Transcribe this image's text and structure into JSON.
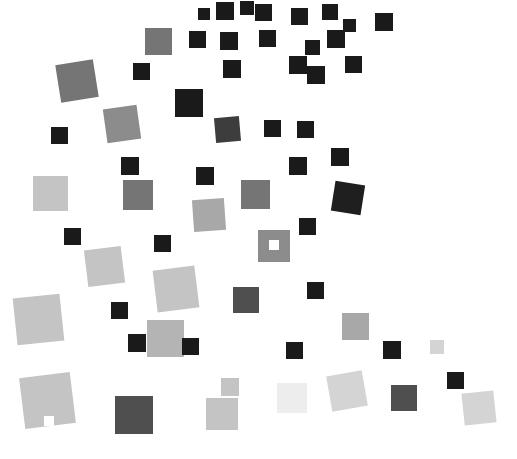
{
  "figure": {
    "type": "scatter-squares-artwork",
    "title": "",
    "width": 517,
    "height": 459,
    "background": "#ffffff"
  },
  "palette": {
    "black": "#1a1a1a",
    "near_black": "#141414",
    "dark_gray": "#3d3d3d",
    "mid_dark_gray": "#4f4f4f",
    "mid_gray": "#757575",
    "gray": "#8c8c8c",
    "light_mid_gray": "#a8a8a8",
    "light_gray": "#c4c4c4",
    "lighter_gray": "#d4d4d4",
    "very_light_gray": "#e2e2e2",
    "palest_gray": "#ededed"
  },
  "chart_data": {
    "type": "scatter",
    "title": "",
    "xlabel": "",
    "ylabel": "",
    "xlim": [
      0,
      517
    ],
    "ylim": [
      0,
      459
    ],
    "grid": false,
    "legend": false,
    "marker": "square",
    "count": 72,
    "squares": [
      {
        "id": 1,
        "x": 216,
        "y": 2,
        "size": 18,
        "rot": 0,
        "color": "#1a1a1a"
      },
      {
        "id": 2,
        "x": 255,
        "y": 4,
        "size": 17,
        "rot": 0,
        "color": "#1a1a1a"
      },
      {
        "id": 3,
        "x": 291,
        "y": 8,
        "size": 17,
        "rot": 0,
        "color": "#1a1a1a"
      },
      {
        "id": 4,
        "x": 322,
        "y": 4,
        "size": 16,
        "rot": 0,
        "color": "#1a1a1a"
      },
      {
        "id": 5,
        "x": 375,
        "y": 13,
        "size": 18,
        "rot": 0,
        "color": "#1a1a1a"
      },
      {
        "id": 6,
        "x": 145,
        "y": 28,
        "size": 27,
        "rot": 0,
        "color": "#757575"
      },
      {
        "id": 7,
        "x": 189,
        "y": 31,
        "size": 17,
        "rot": 0,
        "color": "#1a1a1a"
      },
      {
        "id": 8,
        "x": 220,
        "y": 32,
        "size": 18,
        "rot": 0,
        "color": "#1a1a1a"
      },
      {
        "id": 9,
        "x": 259,
        "y": 30,
        "size": 17,
        "rot": 0,
        "color": "#1a1a1a"
      },
      {
        "id": 10,
        "x": 327,
        "y": 30,
        "size": 18,
        "rot": 0,
        "color": "#1a1a1a"
      },
      {
        "id": 11,
        "x": 133,
        "y": 63,
        "size": 17,
        "rot": 0,
        "color": "#1a1a1a"
      },
      {
        "id": 12,
        "x": 58,
        "y": 62,
        "size": 38,
        "rot": -9,
        "color": "#757575"
      },
      {
        "id": 13,
        "x": 223,
        "y": 60,
        "size": 18,
        "rot": 0,
        "color": "#1a1a1a"
      },
      {
        "id": 14,
        "x": 289,
        "y": 56,
        "size": 18,
        "rot": 0,
        "color": "#1a1a1a"
      },
      {
        "id": 15,
        "x": 345,
        "y": 56,
        "size": 17,
        "rot": 0,
        "color": "#1a1a1a"
      },
      {
        "id": 16,
        "x": 105,
        "y": 107,
        "size": 34,
        "rot": -8,
        "color": "#8c8c8c"
      },
      {
        "id": 17,
        "x": 175,
        "y": 89,
        "size": 28,
        "rot": 0,
        "color": "#1a1a1a"
      },
      {
        "id": 18,
        "x": 307,
        "y": 66,
        "size": 18,
        "rot": 0,
        "color": "#1a1a1a"
      },
      {
        "id": 19,
        "x": 215,
        "y": 117,
        "size": 25,
        "rot": -5,
        "color": "#3d3d3d"
      },
      {
        "id": 20,
        "x": 264,
        "y": 120,
        "size": 17,
        "rot": 0,
        "color": "#1a1a1a"
      },
      {
        "id": 21,
        "x": 297,
        "y": 121,
        "size": 17,
        "rot": 0,
        "color": "#1a1a1a"
      },
      {
        "id": 22,
        "x": 51,
        "y": 127,
        "size": 17,
        "rot": 0,
        "color": "#1a1a1a"
      },
      {
        "id": 23,
        "x": 121,
        "y": 157,
        "size": 18,
        "rot": 0,
        "color": "#1a1a1a"
      },
      {
        "id": 24,
        "x": 196,
        "y": 167,
        "size": 18,
        "rot": 0,
        "color": "#1a1a1a"
      },
      {
        "id": 25,
        "x": 289,
        "y": 157,
        "size": 18,
        "rot": 0,
        "color": "#1a1a1a"
      },
      {
        "id": 26,
        "x": 331,
        "y": 148,
        "size": 18,
        "rot": 0,
        "color": "#1a1a1a"
      },
      {
        "id": 27,
        "x": 33,
        "y": 176,
        "size": 35,
        "rot": 0,
        "color": "#c4c4c4"
      },
      {
        "id": 28,
        "x": 123,
        "y": 180,
        "size": 30,
        "rot": 0,
        "color": "#757575"
      },
      {
        "id": 29,
        "x": 241,
        "y": 180,
        "size": 29,
        "rot": 0,
        "color": "#757575"
      },
      {
        "id": 30,
        "x": 333,
        "y": 183,
        "size": 30,
        "rot": 9,
        "color": "#1f1f1f"
      },
      {
        "id": 31,
        "x": 193,
        "y": 199,
        "size": 32,
        "rot": -4,
        "color": "#a8a8a8"
      },
      {
        "id": 32,
        "x": 299,
        "y": 218,
        "size": 17,
        "rot": 0,
        "color": "#1a1a1a"
      },
      {
        "id": 33,
        "x": 64,
        "y": 228,
        "size": 17,
        "rot": 0,
        "color": "#1a1a1a"
      },
      {
        "id": 34,
        "x": 154,
        "y": 235,
        "size": 17,
        "rot": 0,
        "color": "#1a1a1a"
      },
      {
        "id": 35,
        "x": 258,
        "y": 230,
        "size": 32,
        "rot": 0,
        "color": "#8c8c8c"
      },
      {
        "id": 36,
        "x": 86,
        "y": 248,
        "size": 37,
        "rot": -7,
        "color": "#c4c4c4"
      },
      {
        "id": 37,
        "x": 155,
        "y": 268,
        "size": 42,
        "rot": -7,
        "color": "#c4c4c4"
      },
      {
        "id": 38,
        "x": 233,
        "y": 287,
        "size": 26,
        "rot": 0,
        "color": "#4f4f4f"
      },
      {
        "id": 39,
        "x": 307,
        "y": 282,
        "size": 17,
        "rot": 0,
        "color": "#1a1a1a"
      },
      {
        "id": 40,
        "x": 15,
        "y": 296,
        "size": 47,
        "rot": -6,
        "color": "#c4c4c4"
      },
      {
        "id": 41,
        "x": 111,
        "y": 302,
        "size": 17,
        "rot": 0,
        "color": "#1a1a1a"
      },
      {
        "id": 42,
        "x": 147,
        "y": 320,
        "size": 37,
        "rot": 0,
        "color": "#b4b4b4"
      },
      {
        "id": 43,
        "x": 128,
        "y": 334,
        "size": 18,
        "rot": 0,
        "color": "#1a1a1a"
      },
      {
        "id": 44,
        "x": 182,
        "y": 338,
        "size": 17,
        "rot": 0,
        "color": "#1a1a1a"
      },
      {
        "id": 45,
        "x": 286,
        "y": 342,
        "size": 17,
        "rot": 0,
        "color": "#1a1a1a"
      },
      {
        "id": 46,
        "x": 342,
        "y": 313,
        "size": 27,
        "rot": 0,
        "color": "#a8a8a8"
      },
      {
        "id": 47,
        "x": 383,
        "y": 341,
        "size": 18,
        "rot": 0,
        "color": "#1a1a1a"
      },
      {
        "id": 48,
        "x": 22,
        "y": 375,
        "size": 51,
        "rot": -7,
        "color": "#c4c4c4"
      },
      {
        "id": 49,
        "x": 115,
        "y": 396,
        "size": 38,
        "rot": 0,
        "color": "#4f4f4f"
      },
      {
        "id": 50,
        "x": 221,
        "y": 378,
        "size": 18,
        "rot": 0,
        "color": "#c4c4c4"
      },
      {
        "id": 51,
        "x": 206,
        "y": 398,
        "size": 32,
        "rot": 0,
        "color": "#c4c4c4"
      },
      {
        "id": 52,
        "x": 277,
        "y": 383,
        "size": 30,
        "rot": 0,
        "color": "#ededed"
      },
      {
        "id": 53,
        "x": 329,
        "y": 373,
        "size": 36,
        "rot": -10,
        "color": "#d4d4d4"
      },
      {
        "id": 54,
        "x": 391,
        "y": 385,
        "size": 26,
        "rot": 0,
        "color": "#4f4f4f"
      },
      {
        "id": 55,
        "x": 447,
        "y": 372,
        "size": 17,
        "rot": 0,
        "color": "#1a1a1a"
      },
      {
        "id": 56,
        "x": 463,
        "y": 392,
        "size": 32,
        "rot": -6,
        "color": "#d4d4d4"
      },
      {
        "id": 57,
        "x": 430,
        "y": 340,
        "size": 14,
        "rot": 0,
        "color": "#d4d4d4"
      },
      {
        "id": 58,
        "x": 240,
        "y": 1,
        "size": 14,
        "rot": 0,
        "color": "#1a1a1a"
      },
      {
        "id": 59,
        "x": 305,
        "y": 40,
        "size": 15,
        "rot": 0,
        "color": "#1a1a1a"
      },
      {
        "id": 60,
        "x": 343,
        "y": 19,
        "size": 13,
        "rot": 0,
        "color": "#1a1a1a"
      },
      {
        "id": 61,
        "x": 198,
        "y": 8,
        "size": 12,
        "rot": 0,
        "color": "#1a1a1a"
      },
      {
        "id": 62,
        "x": 330,
        "y": 84,
        "size": 9,
        "rot": 0,
        "color": "#ffffff"
      },
      {
        "id": 63,
        "x": 368,
        "y": 292,
        "size": 15,
        "rot": 0,
        "color": "#ffffff"
      },
      {
        "id": 64,
        "x": 486,
        "y": 95,
        "size": 10,
        "rot": 0,
        "color": "#ffffff"
      },
      {
        "id": 65,
        "x": 269,
        "y": 240,
        "size": 10,
        "rot": 0,
        "color": "#ffffff"
      },
      {
        "id": 66,
        "x": 44,
        "y": 416,
        "size": 10,
        "rot": 0,
        "color": "#ffffff"
      },
      {
        "id": 67,
        "x": 166,
        "y": 133,
        "size": 9,
        "rot": 0,
        "color": "#ffffff"
      },
      {
        "id": 68,
        "x": 400,
        "y": 210,
        "size": 9,
        "rot": 0,
        "color": "#ffffff"
      },
      {
        "id": 69,
        "x": 94,
        "y": 330,
        "size": 9,
        "rot": 0,
        "color": "#ffffff"
      },
      {
        "id": 70,
        "x": 250,
        "y": 60,
        "size": 9,
        "rot": 0,
        "color": "#ffffff"
      },
      {
        "id": 71,
        "x": 420,
        "y": 120,
        "size": 9,
        "rot": 0,
        "color": "#ffffff"
      },
      {
        "id": 72,
        "x": 180,
        "y": 430,
        "size": 9,
        "rot": 0,
        "color": "#ffffff"
      }
    ]
  }
}
